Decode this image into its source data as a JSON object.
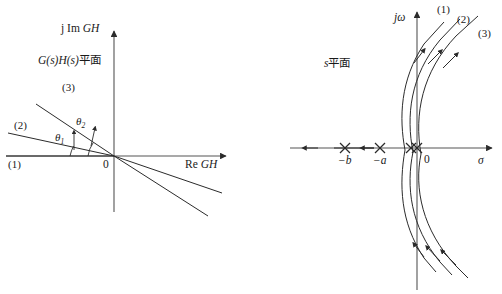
{
  "figure": {
    "background_color": "#ffffff",
    "stroke_color": "#2b2b2b",
    "text_color": "#1a1a1a",
    "left_panel": {
      "plane_label": "G(s)H(s)平面",
      "plane_label_parts": {
        "g": "G",
        "s1": "(s)",
        "h": "H",
        "s2": "(s)",
        "cjk": "平面"
      },
      "vertical_axis_label": "j Im GH",
      "vertical_axis_label_parts": {
        "j": "j Im ",
        "gh": "GH"
      },
      "horizontal_axis_label": "Re GH",
      "horizontal_axis_label_parts": {
        "re": "Re ",
        "gh": "GH"
      },
      "origin_label": "0",
      "branches": [
        {
          "id": "1",
          "label": "(1)"
        },
        {
          "id": "2",
          "label": "(2)"
        },
        {
          "id": "3",
          "label": "(3)"
        }
      ],
      "angles": [
        {
          "id": "theta1",
          "base": "θ",
          "subscript": "1"
        },
        {
          "id": "theta2",
          "base": "θ",
          "subscript": "2"
        }
      ]
    },
    "right_panel": {
      "plane_label": "s平面",
      "plane_label_parts": {
        "s": "s",
        "cjk": "平面"
      },
      "vertical_axis_label": "jω",
      "horizontal_axis_label": "σ",
      "origin_label": "0",
      "poles": [
        {
          "id": "pole-b",
          "label": "−b",
          "symbol": "×"
        },
        {
          "id": "pole-a",
          "label": "−a",
          "symbol": "×"
        },
        {
          "id": "pole-origin",
          "label": "0",
          "symbol": "××"
        }
      ],
      "branches": [
        {
          "id": "1",
          "label": "(1)"
        },
        {
          "id": "2",
          "label": "(2)"
        },
        {
          "id": "3",
          "label": "(3)"
        }
      ]
    }
  }
}
